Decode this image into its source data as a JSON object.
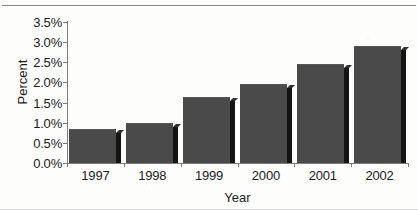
{
  "chart_data": {
    "type": "bar",
    "title": "",
    "subtitle": "",
    "xlabel": "Year",
    "ylabel": "Percent",
    "categories": [
      "1997",
      "1998",
      "1999",
      "2000",
      "2001",
      "2002"
    ],
    "values": [
      0.85,
      1.0,
      1.65,
      1.95,
      2.45,
      2.9
    ],
    "value_labels": [
      "0.85%",
      "1.0%",
      "1.65%",
      "1.95%",
      "2.45%",
      "2.9%"
    ],
    "ylim": [
      0.0,
      3.5
    ],
    "ytick_values": [
      0.0,
      0.5,
      1.0,
      1.5,
      2.0,
      2.5,
      3.0,
      3.5
    ],
    "ytick_labels": [
      "0.0%",
      "0.5%",
      "1.0%",
      "1.5%",
      "2.0%",
      "2.5%",
      "3.0%",
      "3.5%"
    ],
    "grid": false,
    "legend": null,
    "legend_position": "none",
    "series": [
      {
        "name": "Percent",
        "values": [
          0.85,
          1.0,
          1.65,
          1.95,
          2.45,
          2.9
        ]
      }
    ],
    "colors": {
      "bar_fill": "#4a4a4a",
      "bar_shadow": "#141414",
      "axis": "#7d7d7d",
      "text": "#1b1b1b",
      "background": "#fdfdfc"
    }
  }
}
